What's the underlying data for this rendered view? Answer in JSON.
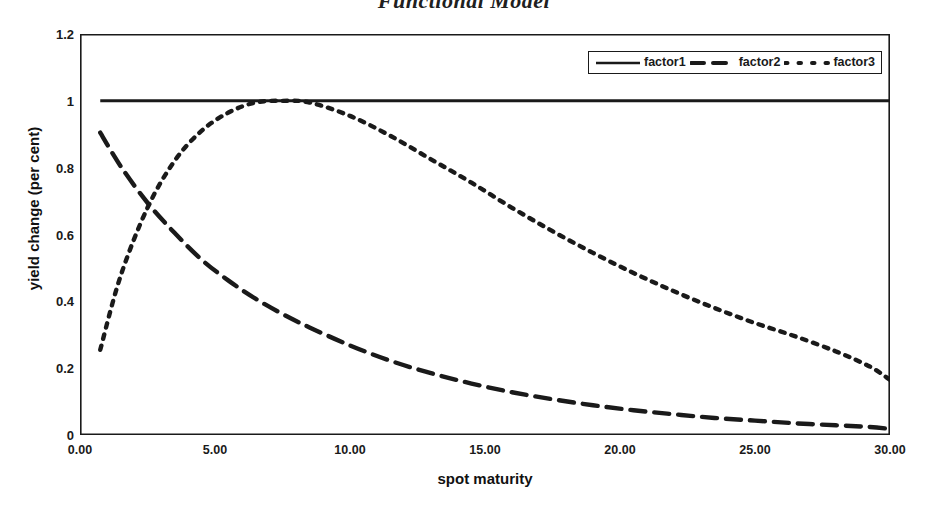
{
  "chart_data": {
    "type": "line",
    "title": "Functional Model",
    "xlabel": "spot maturity",
    "ylabel": "yield change (per cent)",
    "xlim": [
      0,
      30
    ],
    "ylim": [
      0,
      1.2
    ],
    "grid": false,
    "legend_position": "top-right",
    "xticks": [
      "0.00",
      "5.00",
      "10.00",
      "15.00",
      "20.00",
      "25.00",
      "30.00"
    ],
    "xtick_values": [
      0,
      5,
      10,
      15,
      20,
      25,
      30
    ],
    "yticks": [
      "0",
      "0.2",
      "0.4",
      "0.6",
      "0.8",
      "1",
      "1.2"
    ],
    "ytick_values": [
      0,
      0.2,
      0.4,
      0.6,
      0.8,
      1,
      1.2
    ],
    "x": [
      0.75,
      1.5,
      2.5,
      3.5,
      4.5,
      5.5,
      6.5,
      7.5,
      8.5,
      10,
      11.5,
      13,
      14.5,
      16,
      17.5,
      19,
      20.5,
      22,
      23.5,
      25,
      26.5,
      28,
      29.25,
      30
    ],
    "series": [
      {
        "name": "factor1",
        "style": "solid",
        "color": "#1a1a1a",
        "values": [
          1.0,
          1.0,
          1.0,
          1.0,
          1.0,
          1.0,
          1.0,
          1.0,
          1.0,
          1.0,
          1.0,
          1.0,
          1.0,
          1.0,
          1.0,
          1.0,
          1.0,
          1.0,
          1.0,
          1.0,
          1.0,
          1.0,
          1.0,
          1.0
        ]
      },
      {
        "name": "factor2",
        "style": "dashed",
        "color": "#1a1a1a",
        "values": [
          0.905,
          0.805,
          0.695,
          0.605,
          0.525,
          0.462,
          0.408,
          0.362,
          0.322,
          0.268,
          0.222,
          0.185,
          0.154,
          0.128,
          0.107,
          0.089,
          0.074,
          0.062,
          0.051,
          0.043,
          0.035,
          0.029,
          0.024,
          0.018
        ]
      },
      {
        "name": "factor3",
        "style": "dotted",
        "color": "#1a1a1a",
        "values": [
          0.255,
          0.475,
          0.68,
          0.82,
          0.91,
          0.965,
          0.995,
          1.0,
          0.995,
          0.955,
          0.895,
          0.825,
          0.755,
          0.68,
          0.61,
          0.545,
          0.485,
          0.43,
          0.38,
          0.335,
          0.295,
          0.25,
          0.205,
          0.165
        ]
      }
    ]
  },
  "legend": {
    "entries": [
      {
        "label": "factor1",
        "style": "solid"
      },
      {
        "label": "factor2",
        "style": "dashed"
      },
      {
        "label": "factor3",
        "style": "dotted"
      }
    ]
  },
  "axes": {
    "frame_color": "#1a1a1a"
  }
}
